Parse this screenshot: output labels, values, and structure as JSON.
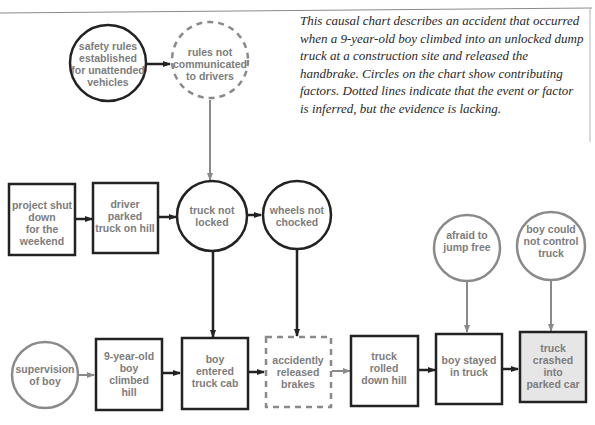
{
  "description": "This causal chart describes an accident that occurred when a 9-year-old boy climbed into an unlocked dump truck at a construction site and released the handbrake. Circles on the chart show contributing factors. Dotted lines indicate that the event or factor is inferred, but the evidence is lacking.",
  "colors": {
    "solid_stroke": "#222222",
    "factor_stroke_gray": "#8a8a8a",
    "text": "#7d7d7d",
    "final_event_fill": "#e6e6e6"
  },
  "nodes": {
    "safety_rules": {
      "shape": "circle",
      "style": "solid",
      "lines": [
        "safety rules",
        "established",
        "for unattended",
        "vehicles"
      ]
    },
    "rules_not_communicated": {
      "shape": "circle",
      "style": "dashed",
      "lines": [
        "rules not",
        "communicated",
        "to drivers"
      ]
    },
    "project_shut_down": {
      "shape": "box",
      "style": "solid",
      "lines": [
        "project shut",
        "down",
        "for the",
        "weekend"
      ]
    },
    "driver_parked": {
      "shape": "box",
      "style": "solid",
      "lines": [
        "driver",
        "parked",
        "truck on hill"
      ]
    },
    "truck_not_locked": {
      "shape": "circle",
      "style": "solid",
      "lines": [
        "truck not",
        "locked"
      ]
    },
    "wheels_not_chocked": {
      "shape": "circle",
      "style": "solid",
      "lines": [
        "wheels not",
        "chocked"
      ]
    },
    "supervision_of_boy": {
      "shape": "circle",
      "style": "gray",
      "lines": [
        "supervision",
        "of boy"
      ]
    },
    "boy_climbed_hill": {
      "shape": "box",
      "style": "solid",
      "lines": [
        "9-year-old",
        "boy",
        "climbed",
        "hill"
      ]
    },
    "boy_entered_cab": {
      "shape": "box",
      "style": "solid",
      "lines": [
        "boy",
        "entered",
        "truck cab"
      ]
    },
    "released_brakes": {
      "shape": "box",
      "style": "dashed",
      "lines": [
        "accidently",
        "released",
        "brakes"
      ]
    },
    "truck_rolled": {
      "shape": "box",
      "style": "solid",
      "lines": [
        "truck",
        "rolled",
        "down hill"
      ]
    },
    "boy_stayed": {
      "shape": "box",
      "style": "solid",
      "lines": [
        "boy stayed",
        "in truck"
      ]
    },
    "truck_crashed": {
      "shape": "box",
      "style": "solid-filled",
      "lines": [
        "truck",
        "crashed",
        "into",
        "parked car"
      ]
    },
    "afraid_to_jump": {
      "shape": "circle",
      "style": "gray",
      "lines": [
        "afraid to",
        "jump free"
      ]
    },
    "boy_could_not_control": {
      "shape": "circle",
      "style": "gray",
      "lines": [
        "boy could",
        "not control",
        "truck"
      ]
    }
  },
  "edges": [
    {
      "from": "safety_rules",
      "to": "rules_not_communicated",
      "style": "solid"
    },
    {
      "from": "rules_not_communicated",
      "to": "truck_not_locked",
      "style": "gray"
    },
    {
      "from": "project_shut_down",
      "to": "driver_parked",
      "style": "solid"
    },
    {
      "from": "driver_parked",
      "to": "truck_not_locked",
      "style": "solid"
    },
    {
      "from": "truck_not_locked",
      "to": "wheels_not_chocked",
      "style": "solid"
    },
    {
      "from": "truck_not_locked",
      "to": "boy_entered_cab",
      "style": "solid"
    },
    {
      "from": "wheels_not_chocked",
      "to": "released_brakes",
      "style": "solid"
    },
    {
      "from": "supervision_of_boy",
      "to": "boy_climbed_hill",
      "style": "gray"
    },
    {
      "from": "boy_climbed_hill",
      "to": "boy_entered_cab",
      "style": "solid"
    },
    {
      "from": "boy_entered_cab",
      "to": "released_brakes",
      "style": "solid"
    },
    {
      "from": "released_brakes",
      "to": "truck_rolled",
      "style": "gray"
    },
    {
      "from": "truck_rolled",
      "to": "boy_stayed",
      "style": "solid"
    },
    {
      "from": "boy_stayed",
      "to": "truck_crashed",
      "style": "solid"
    },
    {
      "from": "afraid_to_jump",
      "to": "boy_stayed",
      "style": "gray"
    },
    {
      "from": "boy_could_not_control",
      "to": "truck_crashed",
      "style": "gray"
    }
  ]
}
